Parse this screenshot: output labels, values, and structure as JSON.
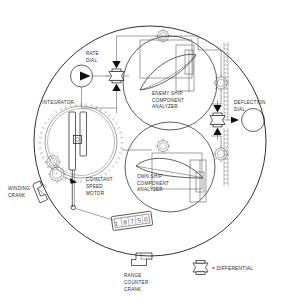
{
  "figure": {
    "background_color": "#ffffff",
    "line_color": "#1a1a1a",
    "text_color": "#2a2a2a"
  },
  "labels": {
    "rate_dial": "RATE\nDIAL",
    "rate_dial_lines": [
      "RATE",
      "DIAL"
    ],
    "integrator": "INTEGRATOR",
    "enemy_ship_analyzer_lines": [
      "ENEMY SHIP",
      "COMPONENT",
      "ANALYZER"
    ],
    "own_ship_analyzer_lines": [
      "OWN SHIP",
      "COMPONENT",
      "ANALYZER"
    ],
    "deflection_dial_lines": [
      "DEFLECTION",
      "DIAL"
    ],
    "winding_crank_lines": [
      "WINDING",
      "CRANK"
    ],
    "constant_speed_motor_lines": [
      "CONSTANT",
      "SPEED",
      "MOTOR"
    ],
    "range_counter_crank_lines": [
      "RANGE",
      "COUNTER",
      "CRANK"
    ],
    "legend_differential": "= DIFFERENTIAL"
  },
  "range_counter": {
    "digits": [
      "1",
      "8",
      "7",
      "5",
      "0"
    ],
    "value": "18750"
  },
  "components": [
    {
      "name": "rate-dial",
      "kind": "dial"
    },
    {
      "name": "deflection-dial",
      "kind": "dial"
    },
    {
      "name": "integrator",
      "kind": "disc-integrator"
    },
    {
      "name": "enemy-ship-component-analyzer",
      "kind": "cam-analyzer"
    },
    {
      "name": "own-ship-component-analyzer",
      "kind": "cam-analyzer"
    },
    {
      "name": "differential-left",
      "kind": "differential"
    },
    {
      "name": "differential-right",
      "kind": "differential"
    },
    {
      "name": "winding-crank",
      "kind": "crank"
    },
    {
      "name": "range-counter-crank",
      "kind": "crank"
    },
    {
      "name": "range-counter",
      "kind": "counter"
    },
    {
      "name": "constant-speed-motor",
      "kind": "motor"
    }
  ]
}
